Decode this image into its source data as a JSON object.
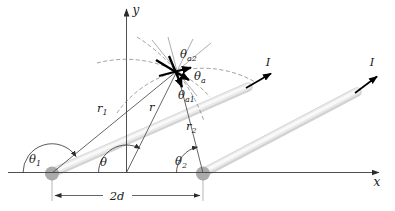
{
  "figure": {
    "labels": {
      "x_axis": "x",
      "y_axis": "y",
      "current1": "I",
      "current2": "I",
      "r": "r",
      "r1": {
        "main": "r",
        "sub": "1"
      },
      "r2": {
        "main": "r",
        "sub": "2"
      },
      "theta": "θ",
      "theta1": {
        "main": "θ",
        "sub": "1"
      },
      "theta2": {
        "main": "θ",
        "sub": "2"
      },
      "theta_a": {
        "main": "θ",
        "sub": "a"
      },
      "theta_a1": {
        "main": "θ",
        "sub": "a1"
      },
      "theta_a2": {
        "main": "θ",
        "sub": "a2"
      },
      "dim": "2d"
    },
    "colors": {
      "background": "#ffffff",
      "line": "#3c3c3c",
      "thin_gray": "#8a8a8a",
      "rod_base": "#d2d2d2",
      "rod_mid": "#e9e9e9",
      "rod_core": "#f9f9f9",
      "dot": "#ababab",
      "bold_vector": "#000000"
    }
  }
}
